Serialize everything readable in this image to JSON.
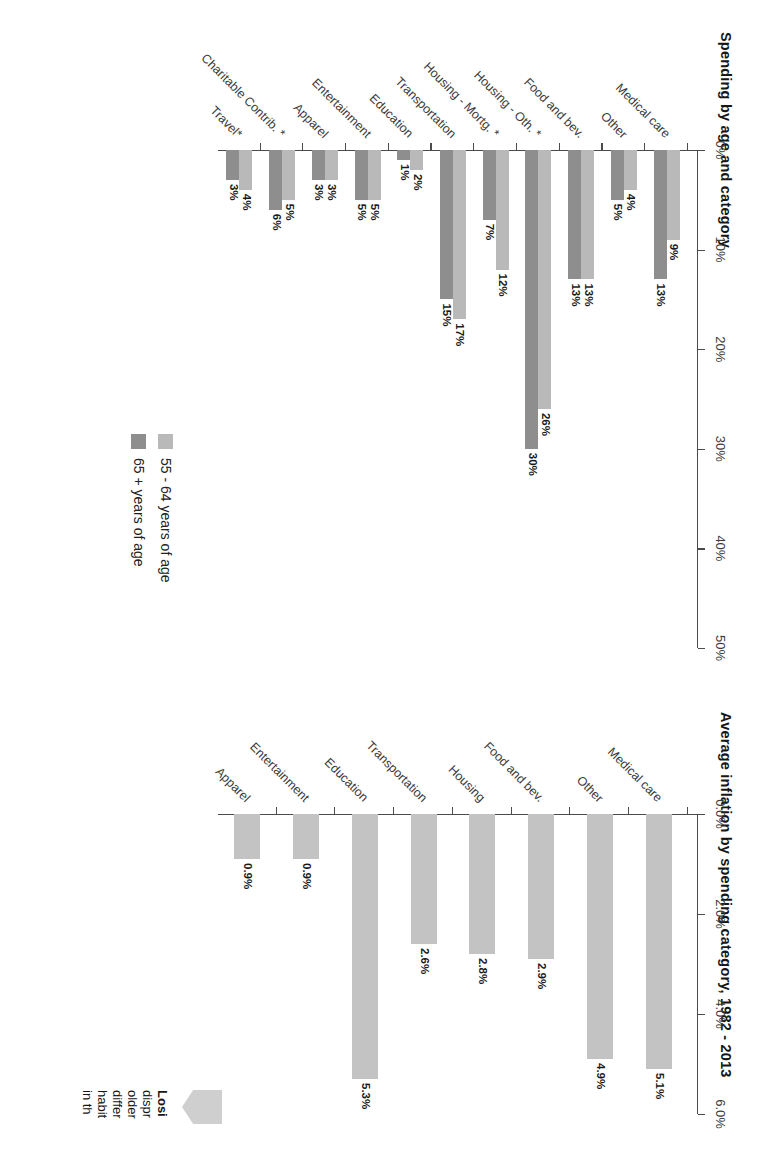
{
  "page": {
    "background": "#ffffff",
    "series_colors": {
      "age_55_64": "#b9b9b9",
      "age_65_plus": "#8e8e8e",
      "inflation": "#c3c3c3"
    }
  },
  "chart_data": [
    {
      "id": "spending-by-age",
      "type": "bar",
      "title": "Spending by age and category",
      "orientation": "vertical",
      "xlabel": "",
      "ylabel": "",
      "ylim": [
        0,
        50
      ],
      "yticks": [
        "0%",
        "10%",
        "20%",
        "30%",
        "40%",
        "50%"
      ],
      "ytick_values": [
        0,
        10,
        20,
        30,
        40,
        50
      ],
      "grid": false,
      "legend_position": "right",
      "categories": [
        "Medical care",
        "Other",
        "Food and bev.",
        "Housing - Oth. *",
        "Housing - Mortg. *",
        "Transportation",
        "Education",
        "Entertainment",
        "Apparel",
        "Charitable Contrib. *",
        "Travel*"
      ],
      "series": [
        {
          "name": "55 - 64 years of age",
          "color": "#b9b9b9",
          "values": [
            9,
            4,
            13,
            26,
            12,
            17,
            2,
            5,
            3,
            5,
            4
          ],
          "labels": [
            "9%",
            "4%",
            "13%",
            "26%",
            "12%",
            "17%",
            "2%",
            "5%",
            "3%",
            "5%",
            "4%"
          ]
        },
        {
          "name": "65 + years of age",
          "color": "#8e8e8e",
          "values": [
            13,
            5,
            13,
            30,
            7,
            15,
            1,
            5,
            3,
            6,
            3
          ],
          "labels": [
            "13%",
            "5%",
            "13%",
            "30%",
            "7%",
            "15%",
            "1%",
            "5%",
            "3%",
            "6%",
            "3%"
          ]
        }
      ]
    },
    {
      "id": "average-inflation",
      "type": "bar",
      "title": "Average inflation by spending category, 1982 - 2013",
      "orientation": "vertical",
      "xlabel": "",
      "ylabel": "",
      "ylim": [
        0,
        6
      ],
      "yticks": [
        "0.0%",
        "2.0%",
        "4.0%",
        "6.0%"
      ],
      "ytick_values": [
        0,
        2,
        4,
        6
      ],
      "grid": false,
      "legend_position": "none",
      "categories": [
        "Medical care",
        "Other",
        "Food and bev.",
        "Housing",
        "Transportation",
        "Education",
        "Entertainment",
        "Apparel"
      ],
      "series": [
        {
          "name": "Average inflation",
          "color": "#c3c3c3",
          "values": [
            5.1,
            4.9,
            2.9,
            2.8,
            2.6,
            5.3,
            0.9,
            0.9
          ],
          "labels": [
            "5.1%",
            "4.9%",
            "2.9%",
            "2.8%",
            "2.6%",
            "5.3%",
            "0.9%",
            "0.9%"
          ]
        }
      ]
    }
  ],
  "legend": {
    "items": [
      {
        "label": "55 - 64 years of age",
        "color": "#b9b9b9"
      },
      {
        "label": "65 + years of age",
        "color": "#8e8e8e"
      }
    ]
  },
  "callout": {
    "heading": "Losi",
    "lines": [
      "dispr",
      "older",
      "differ",
      "habit",
      "in th"
    ]
  }
}
